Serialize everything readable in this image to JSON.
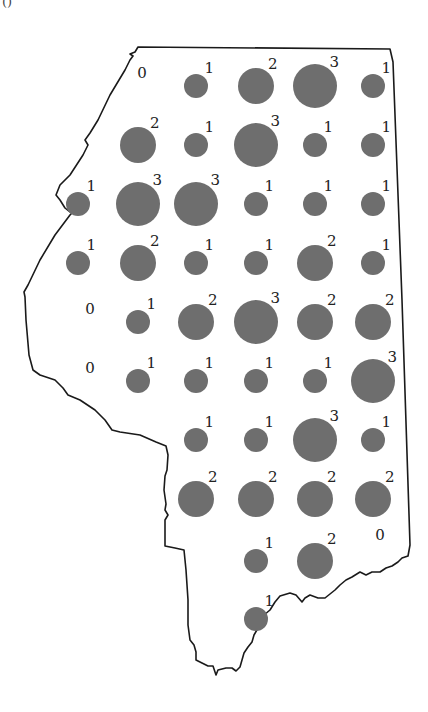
{
  "figure": {
    "panel_label": "()",
    "dot_color": "#6e6e6e",
    "outline_color": "#1a1a1a",
    "label_color": "#222222",
    "radius_by_value": {
      "1": 12,
      "2": 18,
      "3": 22
    }
  },
  "cells": [
    {
      "x": 142,
      "y": 86,
      "value": 0
    },
    {
      "x": 196,
      "y": 86,
      "value": 1
    },
    {
      "x": 256,
      "y": 86,
      "value": 2
    },
    {
      "x": 315,
      "y": 86,
      "value": 3
    },
    {
      "x": 373,
      "y": 86,
      "value": 1
    },
    {
      "x": 138,
      "y": 145,
      "value": 2
    },
    {
      "x": 196,
      "y": 145,
      "value": 1
    },
    {
      "x": 256,
      "y": 145,
      "value": 3
    },
    {
      "x": 315,
      "y": 145,
      "value": 1
    },
    {
      "x": 373,
      "y": 145,
      "value": 1
    },
    {
      "x": 78,
      "y": 204,
      "value": 1
    },
    {
      "x": 138,
      "y": 204,
      "value": 3
    },
    {
      "x": 196,
      "y": 204,
      "value": 3
    },
    {
      "x": 256,
      "y": 204,
      "value": 1
    },
    {
      "x": 315,
      "y": 204,
      "value": 1
    },
    {
      "x": 373,
      "y": 204,
      "value": 1
    },
    {
      "x": 78,
      "y": 263,
      "value": 1
    },
    {
      "x": 138,
      "y": 263,
      "value": 2
    },
    {
      "x": 196,
      "y": 263,
      "value": 1
    },
    {
      "x": 256,
      "y": 263,
      "value": 1
    },
    {
      "x": 315,
      "y": 263,
      "value": 2
    },
    {
      "x": 373,
      "y": 263,
      "value": 1
    },
    {
      "x": 90,
      "y": 322,
      "value": 0
    },
    {
      "x": 138,
      "y": 322,
      "value": 1
    },
    {
      "x": 196,
      "y": 322,
      "value": 2
    },
    {
      "x": 256,
      "y": 322,
      "value": 3
    },
    {
      "x": 315,
      "y": 322,
      "value": 2
    },
    {
      "x": 373,
      "y": 322,
      "value": 2
    },
    {
      "x": 90,
      "y": 381,
      "value": 0
    },
    {
      "x": 138,
      "y": 381,
      "value": 1
    },
    {
      "x": 196,
      "y": 381,
      "value": 1
    },
    {
      "x": 256,
      "y": 381,
      "value": 1
    },
    {
      "x": 315,
      "y": 381,
      "value": 1
    },
    {
      "x": 373,
      "y": 381,
      "value": 3
    },
    {
      "x": 196,
      "y": 440,
      "value": 1
    },
    {
      "x": 256,
      "y": 440,
      "value": 1
    },
    {
      "x": 315,
      "y": 440,
      "value": 3
    },
    {
      "x": 373,
      "y": 440,
      "value": 1
    },
    {
      "x": 196,
      "y": 499,
      "value": 2
    },
    {
      "x": 256,
      "y": 499,
      "value": 2
    },
    {
      "x": 315,
      "y": 499,
      "value": 2
    },
    {
      "x": 373,
      "y": 499,
      "value": 2
    },
    {
      "x": 256,
      "y": 561,
      "value": 1
    },
    {
      "x": 315,
      "y": 561,
      "value": 2
    },
    {
      "x": 380,
      "y": 548,
      "value": 0
    },
    {
      "x": 256,
      "y": 619,
      "value": 1
    }
  ]
}
